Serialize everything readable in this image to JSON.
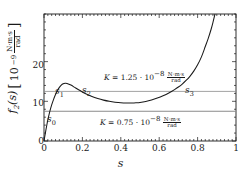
{
  "axes": {
    "ylabel_fn": "f",
    "ylabel_fn_sub": "2",
    "ylabel_fn_arg": "(s)",
    "ylabel_unit_base": "10",
    "ylabel_unit_exp": "−9",
    "ylabel_unit_num": "N·m·s",
    "ylabel_unit_den": "rad",
    "xlabel": "s",
    "xticks": [
      "0",
      "0.2",
      "0.4",
      "0.6",
      "0.8",
      "1"
    ],
    "xtick_values": [
      0,
      0.2,
      0.4,
      0.6,
      0.8,
      1
    ],
    "yticks": [
      "0",
      "10",
      "20"
    ],
    "ytick_values": [
      0,
      10,
      20
    ]
  },
  "annotations": [
    {
      "id": "K-upper",
      "symbol": "K",
      "equals": "=",
      "coefficient": "1.25",
      "dot": "·",
      "base": "10",
      "exponent": "−8",
      "unit_num": "N·m·s",
      "unit_den": "rad",
      "value": 12.5
    },
    {
      "id": "K-lower",
      "symbol": "K",
      "equals": "=",
      "coefficient": "0.75",
      "dot": "·",
      "base": "10",
      "exponent": "−8",
      "unit_num": "N·m·s",
      "unit_den": "rad",
      "value": 7.5
    }
  ],
  "point_labels": [
    {
      "name": "s0",
      "letter": "s",
      "sub": "0",
      "x": 0.035,
      "y": 7.5
    },
    {
      "name": "s1",
      "letter": "s",
      "sub": "1",
      "x": 0.068,
      "y": 12.5
    },
    {
      "name": "s2",
      "letter": "s",
      "sub": "2",
      "x": 0.212,
      "y": 12.5
    },
    {
      "name": "s3",
      "letter": "s",
      "sub": "3",
      "x": 0.735,
      "y": 12.5
    }
  ],
  "chart_data": {
    "type": "line",
    "title": "",
    "xlabel": "s",
    "ylabel": "f2(s) [10^-9 N·m·s/rad]",
    "xlim": [
      0,
      1
    ],
    "ylim": [
      0,
      32
    ],
    "grid": false,
    "legend": null,
    "series": [
      {
        "name": "f2(s)",
        "color": "#1a1a1a",
        "x": [
          0.0,
          0.005,
          0.01,
          0.015,
          0.02,
          0.03,
          0.04,
          0.05,
          0.06,
          0.07,
          0.08,
          0.09,
          0.1,
          0.11,
          0.12,
          0.14,
          0.16,
          0.18,
          0.2,
          0.22,
          0.25,
          0.28,
          0.31,
          0.34,
          0.37,
          0.4,
          0.43,
          0.46,
          0.48,
          0.5,
          0.53,
          0.56,
          0.59,
          0.62,
          0.65,
          0.68,
          0.7,
          0.72,
          0.74,
          0.76,
          0.78,
          0.8,
          0.82,
          0.84,
          0.855,
          0.87,
          0.88,
          0.89,
          0.9,
          0.91,
          0.918
        ],
        "y": [
          0.0,
          1.4,
          2.8,
          4.1,
          5.3,
          7.4,
          9.1,
          10.5,
          11.7,
          12.7,
          13.5,
          14.1,
          14.45,
          14.55,
          14.5,
          14.1,
          13.5,
          12.9,
          12.35,
          11.85,
          11.2,
          10.7,
          10.3,
          10.0,
          9.78,
          9.63,
          9.56,
          9.56,
          9.62,
          9.72,
          9.98,
          10.35,
          10.82,
          11.4,
          12.1,
          12.95,
          13.6,
          14.35,
          15.25,
          16.3,
          17.6,
          19.2,
          21.2,
          23.8,
          25.8,
          28.1,
          29.9,
          31.9,
          34.2,
          37.0,
          39.0
        ]
      }
    ],
    "horizontal_lines": [
      {
        "label": "K = 1.25e-8",
        "value": 12.5,
        "color": "#8a8a8a"
      },
      {
        "label": "K = 0.75e-8",
        "value": 7.5,
        "color": "#8a8a8a"
      }
    ],
    "markers": [
      {
        "label": "s0",
        "x": 0.035,
        "y": 7.5
      },
      {
        "label": "s1",
        "x": 0.068,
        "y": 12.5
      },
      {
        "label": "s2",
        "x": 0.212,
        "y": 12.5
      },
      {
        "label": "s3",
        "x": 0.735,
        "y": 12.5
      }
    ],
    "features": {
      "local_max": {
        "x": 0.11,
        "y": 14.55
      },
      "local_min": {
        "x": 0.47,
        "y": 9.56
      }
    }
  }
}
